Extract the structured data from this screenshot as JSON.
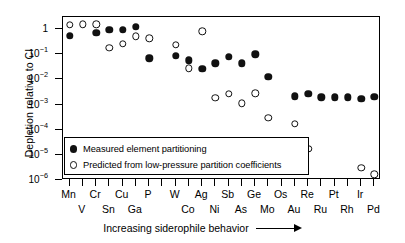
{
  "chart_data": {
    "type": "scatter",
    "title": "",
    "xlabel": "Increasing siderophile behavior",
    "ylabel": "Depletion relative to CI",
    "yscale": "log",
    "ylim": [
      1e-06,
      3
    ],
    "grid": false,
    "legend_position": "lower-left",
    "y_ticklabels": [
      "1",
      "10-1",
      "10-2",
      "10-3",
      "10-4",
      "10-5",
      "10-6"
    ],
    "y_tickvalues": [
      1,
      0.1,
      0.01,
      0.001,
      0.0001,
      1e-05,
      1e-06
    ],
    "categories": [
      "Mn",
      "V",
      "Cr",
      "Sn",
      "Cu",
      "Ga",
      "P",
      "",
      "W",
      "Co",
      "Ag",
      "Ni",
      "Sb",
      "As",
      "Ge",
      "Mo",
      "Os",
      "Au",
      "Re",
      "Ru",
      "Pt",
      "Rh",
      "Ir",
      "Pd"
    ],
    "series": [
      {
        "name": "Measured element partitioning",
        "marker": "filled-circle",
        "color": "#111111",
        "values": [
          0.55,
          null,
          0.72,
          0.95,
          0.93,
          1.22,
          0.068,
          null,
          0.088,
          0.058,
          0.026,
          0.043,
          0.079,
          0.044,
          0.1,
          0.0125,
          null,
          0.0021,
          0.0027,
          0.0019,
          0.0019,
          0.0019,
          0.0017,
          0.002
        ]
      },
      {
        "name": "Predicted from low-pressure partition coefficients",
        "marker": "open-circle",
        "color": "#111111",
        "values": [
          1.45,
          1.55,
          1.52,
          0.18,
          0.26,
          0.52,
          0.42,
          null,
          0.23,
          0.027,
          0.8,
          0.0018,
          0.0027,
          0.0011,
          0.0028,
          0.0003,
          null,
          0.00017,
          1.7e-05,
          null,
          null,
          null,
          3e-06,
          1.7e-06
        ]
      }
    ],
    "legend_entries": [
      "Measured element partitioning",
      "Predicted from low-pressure partition coefficients"
    ]
  }
}
